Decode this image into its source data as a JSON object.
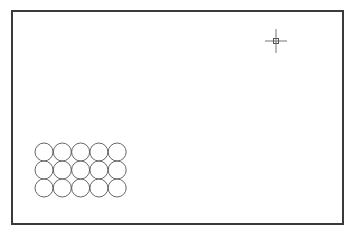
{
  "drawing": {
    "frame_color": "#3a3a3a",
    "stroke_color": "#555555",
    "circle_array": {
      "rows": 3,
      "columns": 5,
      "radius": 9,
      "origin": [
        44,
        152
      ],
      "spacing": [
        18.3,
        18
      ]
    },
    "cursor": {
      "type": "crosshair-pickbox",
      "position": [
        276,
        41
      ]
    }
  }
}
